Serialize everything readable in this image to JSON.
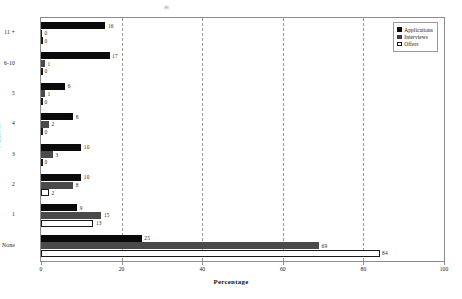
{
  "chart_data": {
    "type": "bar",
    "orientation": "horizontal",
    "title": "",
    "xlabel": "Percentage",
    "ylabel": "Number",
    "xlim": [
      0,
      100
    ],
    "xticks": [
      0,
      20,
      40,
      60,
      80,
      100
    ],
    "grid": "vertical dashed gridlines at 20, 40, 60, 80",
    "legend_position": "top-right inside plot area",
    "categories": [
      "11 +",
      "6-10",
      "5",
      "4",
      "3",
      "2",
      "1",
      "None"
    ],
    "series": [
      {
        "name": "Applications",
        "color": "#0a0a0a",
        "values": [
          16,
          17,
          6,
          8,
          10,
          10,
          9,
          25
        ]
      },
      {
        "name": "Interviews",
        "color": "#4a4a4a",
        "values": [
          0,
          1,
          1,
          2,
          3,
          8,
          15,
          69
        ]
      },
      {
        "name": "Offers",
        "color": "#ffffff",
        "values": [
          0,
          0,
          0,
          0,
          0,
          2,
          13,
          84
        ]
      }
    ]
  },
  "axis": {
    "y_title": "Number",
    "x_title": "Percentage",
    "y_categories": [
      "11 +",
      "6-10",
      "5",
      "4",
      "3",
      "2",
      "1",
      "None"
    ],
    "x_ticks": [
      "0",
      "20",
      "40",
      "60",
      "80",
      "100"
    ]
  },
  "legend": {
    "items": [
      {
        "label": "Applications"
      },
      {
        "label": "Interviews"
      },
      {
        "label": "Offers"
      }
    ]
  },
  "bar_labels": {
    "r0": [
      "16",
      "0",
      "0"
    ],
    "r1": [
      "17",
      "1",
      "0"
    ],
    "r2": [
      "6",
      "1",
      "0"
    ],
    "r3": [
      "8",
      "2",
      "0"
    ],
    "r4": [
      "10",
      "3",
      "0"
    ],
    "r5": [
      "10",
      "8",
      "2"
    ],
    "r6": [
      "9",
      "15",
      "13"
    ],
    "r7": [
      "25",
      "69",
      "84"
    ]
  }
}
